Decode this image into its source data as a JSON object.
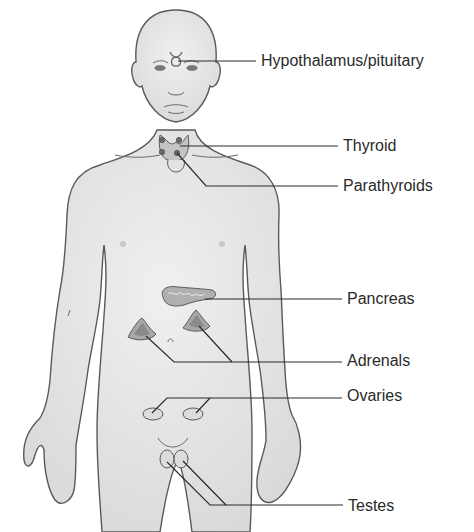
{
  "diagram": {
    "colors": {
      "skin": "#e6e6e6",
      "outline": "#5a5a5a",
      "gland": "#bdbdbd",
      "gland_dark": "#8f8f8f",
      "leader_line": "#2a2a2a",
      "text": "#2a2a2a"
    },
    "labels": [
      {
        "id": "hypothalamus",
        "text": "Hypothalamus/pituitary",
        "x": 261,
        "y": 53
      },
      {
        "id": "thyroid",
        "text": "Thyroid",
        "x": 343,
        "y": 138
      },
      {
        "id": "parathyroids",
        "text": "Parathyroids",
        "x": 343,
        "y": 178
      },
      {
        "id": "pancreas",
        "text": "Pancreas",
        "x": 347,
        "y": 291
      },
      {
        "id": "adrenals",
        "text": "Adrenals",
        "x": 347,
        "y": 353
      },
      {
        "id": "ovaries",
        "text": "Ovaries",
        "x": 347,
        "y": 388
      },
      {
        "id": "testes",
        "text": "Testes",
        "x": 348,
        "y": 498
      }
    ]
  }
}
